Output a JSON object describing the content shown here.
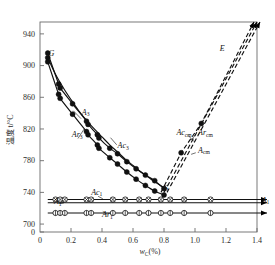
{
  "chart_data": {
    "type": "line",
    "title": "",
    "xlabel": "wC(%)",
    "ylabel": "温度 t/°C",
    "xlim": [
      0,
      1.4
    ],
    "ylim": [
      690,
      955
    ],
    "grid": false,
    "legend": "none",
    "x_ticks": [
      "0",
      "0.2",
      "0.4",
      "0.6",
      "0.8",
      "1.0",
      "1.2",
      "1.4"
    ],
    "x_tick_values": [
      0,
      0.2,
      0.4,
      0.6,
      0.8,
      1.0,
      1.2,
      1.4
    ],
    "y_ticks": [
      "0",
      "700",
      "740",
      "780",
      "820",
      "860",
      "900",
      "940"
    ],
    "y_tick_values": [
      690,
      700,
      740,
      780,
      820,
      860,
      900,
      940
    ],
    "annotations": [
      {
        "id": "G",
        "text": "G",
        "x": 0.055,
        "y": 912
      },
      {
        "id": "S",
        "text": "S",
        "x": 0.8,
        "y": 742
      },
      {
        "id": "E",
        "text": "E",
        "x": 1.16,
        "y": 918
      },
      {
        "id": "A3",
        "text": "A3",
        "x": 0.27,
        "y": 838
      },
      {
        "id": "Ar3",
        "text": "Ar3",
        "x": 0.205,
        "y": 810
      },
      {
        "id": "Ac3",
        "text": "Ac3",
        "x": 0.5,
        "y": 796
      },
      {
        "id": "Accm",
        "text": "Accm",
        "x": 0.88,
        "y": 812
      },
      {
        "id": "Arcm",
        "text": "Arcm",
        "x": 1.02,
        "y": 812
      },
      {
        "id": "Acm",
        "text": "Acm",
        "x": 1.02,
        "y": 790
      },
      {
        "id": "A1",
        "text": "A1",
        "x": 0.09,
        "y": 725
      },
      {
        "id": "Ac1",
        "text": "Ac1",
        "x": 0.33,
        "y": 737
      },
      {
        "id": "Ar1",
        "text": "Ar1",
        "x": 0.4,
        "y": 709
      },
      {
        "id": "A1r",
        "text": "A1",
        "x": 1.43,
        "y": 727
      }
    ],
    "series": [
      {
        "name": "A3",
        "style": "solid-center",
        "marker": "none",
        "x": [
          0.05,
          0.1,
          0.15,
          0.2,
          0.25,
          0.3,
          0.35,
          0.4,
          0.45,
          0.5,
          0.55,
          0.6,
          0.65,
          0.7,
          0.75,
          0.8
        ],
        "y": [
          910,
          889,
          872,
          857,
          843,
          831,
          820,
          810,
          800,
          791,
          782,
          774,
          766,
          759,
          752,
          746
        ]
      },
      {
        "name": "Ac3",
        "style": "solid-lower",
        "marker": "filled-circle",
        "x": [
          0.05,
          0.12,
          0.13,
          0.21,
          0.3,
          0.31,
          0.37,
          0.38,
          0.45,
          0.5,
          0.56,
          0.62,
          0.68,
          0.74,
          0.8
        ],
        "y": [
          908,
          867,
          862,
          842,
          820,
          816,
          803,
          799,
          787,
          779,
          769,
          760,
          752,
          745,
          740
        ]
      },
      {
        "name": "Ar3",
        "style": "solid-upper",
        "marker": "filled-circle",
        "x": [
          0.05,
          0.12,
          0.13,
          0.21,
          0.3,
          0.31,
          0.37,
          0.38,
          0.45,
          0.5,
          0.56,
          0.62,
          0.68,
          0.74,
          0.8
        ],
        "y": [
          913,
          874,
          869,
          849,
          827,
          823,
          810,
          806,
          793,
          786,
          776,
          767,
          759,
          752,
          742
        ]
      },
      {
        "name": "Acm",
        "style": "dashed-center",
        "marker": "none",
        "x": [
          0.8,
          1.4
        ],
        "y": [
          740,
          955
        ]
      },
      {
        "name": "Accm",
        "style": "dashed-left",
        "marker": "filled-circle",
        "x": [
          0.8,
          0.93,
          1.06,
          1.4
        ],
        "y": [
          740,
          790,
          827,
          955
        ]
      },
      {
        "name": "Arcm",
        "style": "dashed-right",
        "marker": "none",
        "x": [
          0.8,
          1.4
        ],
        "y": [
          740,
          955
        ]
      },
      {
        "name": "Ac1",
        "style": "horizontal-solid",
        "marker": "cross-circle",
        "y_level": 731,
        "x": [
          0.1,
          0.13,
          0.16,
          0.3,
          0.33,
          0.47,
          0.55,
          0.64,
          0.7,
          0.78,
          0.84,
          0.93,
          1.1
        ],
        "x_start": 0.05,
        "x_end": 1.4
      },
      {
        "name": "A1",
        "style": "horizontal-solid",
        "marker": "none",
        "y_level": 727,
        "x_start": 0.05,
        "x_end": 1.4
      },
      {
        "name": "Ar1",
        "style": "horizontal-solid",
        "marker": "open-circle",
        "y_level": 714,
        "x": [
          0.1,
          0.13,
          0.16,
          0.3,
          0.33,
          0.47,
          0.55,
          0.64,
          0.7,
          0.78,
          0.84,
          0.93,
          1.1
        ],
        "x_start": 0.05,
        "x_end": 1.4
      }
    ]
  },
  "figure": {
    "y_axis_title": "温度 t/°C",
    "x_axis_title_main": "w",
    "x_axis_title_sub": "C",
    "x_axis_title_tail": "(%)"
  }
}
